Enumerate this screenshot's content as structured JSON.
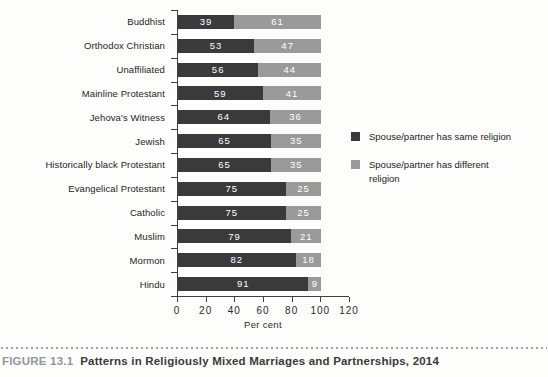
{
  "figure": {
    "number": "FIGURE 13.1",
    "title": "Patterns in Religiously Mixed Marriages and Partnerships, 2014"
  },
  "chart_data": {
    "type": "bar",
    "orientation": "horizontal",
    "stacked": true,
    "categories": [
      "Buddhist",
      "Orthodox Christian",
      "Unaffiliated",
      "Mainline Protestant",
      "Jehova's Witness",
      "Jewish",
      "Historically black Protestant",
      "Evangelical Protestant",
      "Catholic",
      "Muslim",
      "Mormon",
      "Hindu"
    ],
    "series": [
      {
        "name": "Spouse/partner has same religion",
        "color": "#3a3a3c",
        "values": [
          39,
          53,
          56,
          59,
          64,
          65,
          65,
          75,
          75,
          79,
          82,
          91
        ]
      },
      {
        "name": "Spouse/partner has different religion",
        "color": "#9a9a9a",
        "values": [
          61,
          47,
          44,
          41,
          36,
          35,
          35,
          25,
          25,
          21,
          18,
          9
        ]
      }
    ],
    "xlabel": "Per cent",
    "xlim": [
      0,
      120
    ],
    "xticks": [
      0,
      20,
      40,
      60,
      80,
      100,
      120
    ],
    "legend_position": "right",
    "value_labels": true,
    "grid": false
  },
  "palette": {
    "same_religion": "#3a3a3c",
    "different_religion": "#9a9a9a",
    "axis": "#3e3e40",
    "figure_number_text": "#8e999d",
    "caption_text": "#3a3a3a",
    "dotted_rule": "#9aa3a5"
  }
}
